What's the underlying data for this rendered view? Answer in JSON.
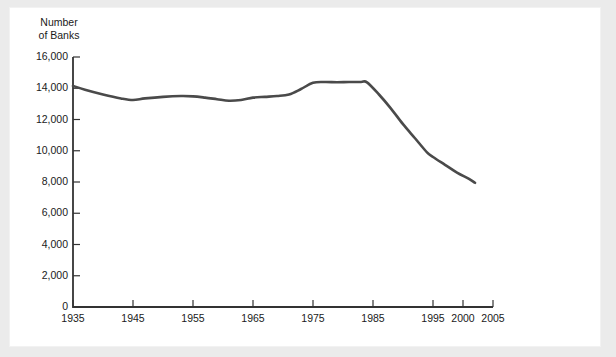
{
  "figure": {
    "background_color": "#ebebeb",
    "card_color": "#ffffff",
    "line_color": "#4a4a4a",
    "axis_color": "#333333",
    "text_color": "#1a1a1a"
  },
  "axis_title": {
    "line1": "Number",
    "line2": "of Banks"
  },
  "chart_data": {
    "type": "line",
    "title": "",
    "xlabel": "",
    "ylabel": "Number of Banks",
    "ylim": [
      0,
      16000
    ],
    "xlim": [
      1935,
      2005
    ],
    "grid": false,
    "legend": null,
    "ytick_labels": [
      "16,000",
      "14,000",
      "12,000",
      "10,000",
      "8,000",
      "6,000",
      "4,000",
      "2,000",
      "0"
    ],
    "ytick_values": [
      16000,
      14000,
      12000,
      10000,
      8000,
      6000,
      4000,
      2000,
      0
    ],
    "xtick_labels": [
      "1935",
      "1945",
      "1955",
      "1965",
      "1975",
      "1985",
      "1995",
      "2000",
      "2005"
    ],
    "xtick_values": [
      1935,
      1945,
      1955,
      1965,
      1975,
      1985,
      1995,
      2000,
      2005
    ],
    "series": [
      {
        "name": "Number of Banks",
        "color": "#4a4a4a",
        "x": [
          1935,
          1937,
          1940,
          1943,
          1945,
          1947,
          1950,
          1953,
          1955,
          1957,
          1959,
          1961,
          1963,
          1965,
          1967,
          1969,
          1971,
          1973,
          1975,
          1977,
          1979,
          1981,
          1983,
          1984,
          1986,
          1988,
          1990,
          1992,
          1994,
          1995,
          1997,
          1999,
          2001,
          2002
        ],
        "y": [
          14150,
          13900,
          13600,
          13350,
          13250,
          13350,
          13450,
          13500,
          13480,
          13400,
          13300,
          13200,
          13250,
          13400,
          13450,
          13500,
          13600,
          13950,
          14350,
          14400,
          14380,
          14400,
          14400,
          14380,
          13600,
          12700,
          11700,
          10800,
          9900,
          9600,
          9100,
          8600,
          8200,
          7950
        ]
      }
    ]
  }
}
